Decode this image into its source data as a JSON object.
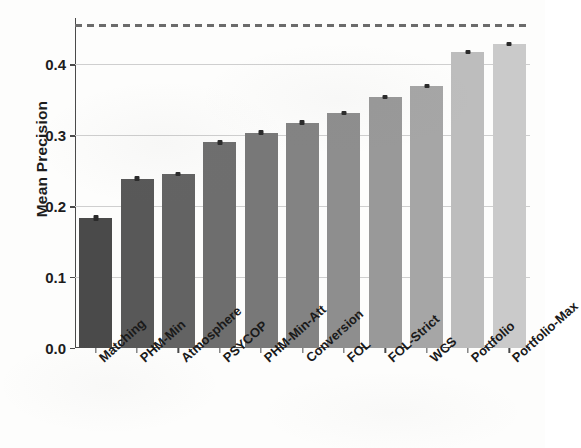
{
  "chart_data": {
    "type": "bar",
    "title": "",
    "xlabel": "",
    "ylabel": "Mean Precision",
    "categories": [
      "Matching",
      "PHM-Min",
      "Atmosphere",
      "PSYCOP",
      "PHM-Min-Att",
      "Conversion",
      "FOL",
      "FOL-Strict",
      "WCS",
      "Portfolio",
      "Portfolio-Max"
    ],
    "values": [
      0.183,
      0.239,
      0.245,
      0.29,
      0.304,
      0.318,
      0.331,
      0.354,
      0.37,
      0.418,
      0.429
    ],
    "errors": [
      0.004,
      0.003,
      0.003,
      0.003,
      0.003,
      0.003,
      0.003,
      0.003,
      0.003,
      0.003,
      0.003
    ],
    "bar_colors": [
      "#4a4a4a",
      "#585858",
      "#636363",
      "#6e6e6e",
      "#787878",
      "#838383",
      "#8e8e8e",
      "#999999",
      "#a6a6a6",
      "#bdbdbd",
      "#cacaca"
    ],
    "ylim": [
      0.0,
      0.4655
    ],
    "yticks": [
      0.0,
      0.1,
      0.2,
      0.3,
      0.4
    ],
    "ytick_labels": [
      "0.0",
      "0.1",
      "0.2",
      "0.3",
      "0.4"
    ],
    "grid": true,
    "grid_axis": "y",
    "grid_color": "#cfcfcf",
    "legend": false,
    "reference_line": {
      "value": 0.455,
      "style": "dashed",
      "color": "#6b6b6b"
    },
    "xtick_rotation": -42,
    "errorbar_color": "#2a2a2a",
    "axis_color": "#4a4a4a",
    "background_color": "#fdfdfc"
  }
}
